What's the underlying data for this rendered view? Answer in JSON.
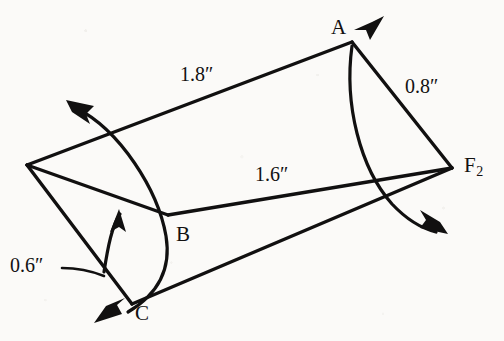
{
  "figure": {
    "background_color": "#fbfaf8",
    "ink_color": "#111010",
    "vertices": [
      {
        "id": "A",
        "label": "A",
        "sub": "",
        "x": 352,
        "y": 42,
        "label_x": 331,
        "label_y": 17
      },
      {
        "id": "B",
        "label": "B",
        "sub": "",
        "x": 168,
        "y": 215,
        "label_x": 176,
        "label_y": 224
      },
      {
        "id": "C",
        "label": "C",
        "sub": "",
        "x": 132,
        "y": 304,
        "label_x": 135,
        "label_y": 303
      },
      {
        "id": "F2",
        "label": "F",
        "sub": "2",
        "x": 452,
        "y": 168,
        "label_x": 464,
        "label_y": 155
      }
    ],
    "dimensions": [
      {
        "id": "dim-ab",
        "text": "1.8″",
        "x": 180,
        "y": 64,
        "describes": "edge from left vertex to A"
      },
      {
        "id": "dim-af2",
        "text": "0.8″",
        "x": 405,
        "y": 76,
        "describes": "edge from A to F2"
      },
      {
        "id": "dim-bf2",
        "text": "1.6″",
        "x": 255,
        "y": 164,
        "describes": "edge from B to F2"
      },
      {
        "id": "dim-bc",
        "text": "0.6″",
        "x": 10,
        "y": 255,
        "describes": "arc leader to rotation arc near C"
      }
    ],
    "rotation_arrows": [
      {
        "id": "arrow-top-left",
        "direction": "up-left",
        "tip_x": 68,
        "tip_y": 101
      },
      {
        "id": "arrow-a",
        "direction": "up-right",
        "tip_x": 382,
        "tip_y": 18
      },
      {
        "id": "arrow-b-inner",
        "direction": "up",
        "tip_x": 118,
        "tip_y": 211
      },
      {
        "id": "arrow-c",
        "direction": "down-left",
        "tip_x": 96,
        "tip_y": 322
      },
      {
        "id": "arrow-bottom-right",
        "direction": "down-right",
        "tip_x": 446,
        "tip_y": 233
      }
    ]
  }
}
